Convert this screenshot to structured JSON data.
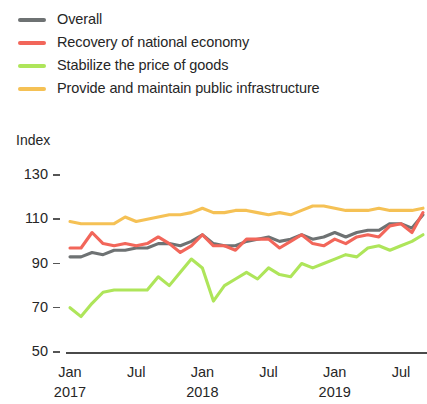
{
  "legend": {
    "items": [
      {
        "label": "Overall",
        "color": "#6e7273"
      },
      {
        "label": "Recovery of national economy",
        "color": "#f2665a"
      },
      {
        "label": "Stabilize the price of goods",
        "color": "#aee55a"
      },
      {
        "label": "Provide and maintain public infrastructure",
        "color": "#f5c155"
      }
    ]
  },
  "axes": {
    "y_title": "Index",
    "y_ticks": [
      "130",
      "110",
      "90",
      "70",
      "50"
    ],
    "x_ticks": [
      {
        "month": "Jan",
        "year": "2017"
      },
      {
        "month": "Jul",
        "year": ""
      },
      {
        "month": "Jan",
        "year": "2018"
      },
      {
        "month": "Jul",
        "year": ""
      },
      {
        "month": "Jan",
        "year": "2019"
      },
      {
        "month": "Jul",
        "year": ""
      }
    ]
  },
  "chart_data": {
    "type": "line",
    "title": "",
    "xlabel": "",
    "ylabel": "Index",
    "ylim": [
      50,
      130
    ],
    "yticks": [
      50,
      70,
      90,
      110,
      130
    ],
    "grid": false,
    "legend_position": "top-left",
    "x": [
      "2017-01",
      "2017-02",
      "2017-03",
      "2017-04",
      "2017-05",
      "2017-06",
      "2017-07",
      "2017-08",
      "2017-09",
      "2017-10",
      "2017-11",
      "2017-12",
      "2018-01",
      "2018-02",
      "2018-03",
      "2018-04",
      "2018-05",
      "2018-06",
      "2018-07",
      "2018-08",
      "2018-09",
      "2018-10",
      "2018-11",
      "2018-12",
      "2019-01",
      "2019-02",
      "2019-03",
      "2019-04",
      "2019-05",
      "2019-06",
      "2019-07",
      "2019-08",
      "2019-09"
    ],
    "xtick_labels": [
      "Jan 2017",
      "Jul",
      "Jan 2018",
      "Jul",
      "Jan 2019",
      "Jul"
    ],
    "xtick_index": [
      0,
      6,
      12,
      18,
      24,
      30
    ],
    "series": [
      {
        "name": "Overall",
        "color": "#6e7273",
        "values": [
          93,
          93,
          95,
          94,
          96,
          96,
          97,
          97,
          99,
          99,
          98,
          100,
          103,
          99,
          98,
          98,
          100,
          101,
          102,
          100,
          101,
          103,
          101,
          102,
          104,
          102,
          104,
          105,
          105,
          108,
          108,
          106,
          112
        ]
      },
      {
        "name": "Recovery of national economy",
        "color": "#f2665a",
        "values": [
          97,
          97,
          104,
          99,
          98,
          99,
          98,
          99,
          102,
          99,
          95,
          98,
          103,
          98,
          98,
          96,
          101,
          101,
          101,
          97,
          100,
          103,
          99,
          98,
          101,
          99,
          102,
          103,
          102,
          107,
          108,
          104,
          113
        ]
      },
      {
        "name": "Stabilize the price of goods",
        "color": "#aee55a",
        "values": [
          70,
          66,
          72,
          77,
          78,
          78,
          78,
          78,
          84,
          80,
          86,
          92,
          88,
          73,
          80,
          83,
          86,
          83,
          88,
          85,
          84,
          90,
          88,
          90,
          92,
          94,
          93,
          97,
          98,
          96,
          98,
          100,
          103
        ]
      },
      {
        "name": "Provide and maintain public infrastructure",
        "color": "#f5c155",
        "values": [
          109,
          108,
          108,
          108,
          108,
          111,
          109,
          110,
          111,
          112,
          112,
          113,
          115,
          113,
          113,
          114,
          114,
          113,
          112,
          113,
          112,
          114,
          116,
          116,
          115,
          114,
          114,
          114,
          115,
          114,
          114,
          114,
          115
        ]
      }
    ]
  }
}
